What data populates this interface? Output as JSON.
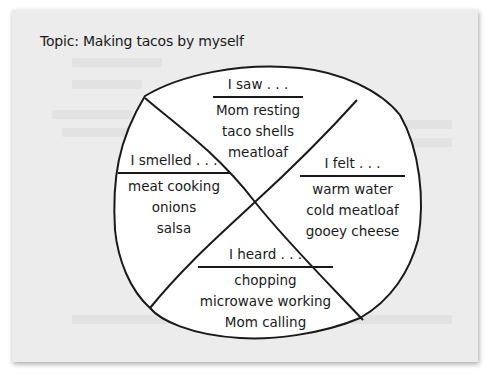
{
  "topic": "Topic: Making tacos by myself",
  "colors": {
    "paper": "#ececec",
    "shape_fill": "#ffffff",
    "ink": "#1a1a1a"
  },
  "sections": {
    "saw": {
      "heading": "I saw . . .",
      "items": [
        "Mom resting",
        "taco shells",
        "meatloaf"
      ]
    },
    "smelled": {
      "heading": "I smelled . . .",
      "items": [
        "meat cooking",
        "onions",
        "salsa"
      ]
    },
    "felt": {
      "heading": "I felt . . .",
      "items": [
        "warm water",
        "cold meatloaf",
        "gooey cheese"
      ]
    },
    "heard": {
      "heading": "I heard . . .",
      "items": [
        "chopping",
        "microwave working",
        "Mom calling"
      ]
    }
  }
}
